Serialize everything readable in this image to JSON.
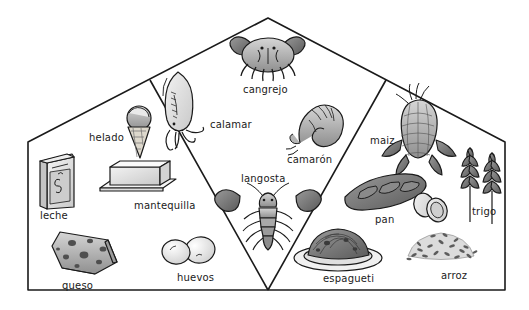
{
  "diagram": {
    "title_text": "",
    "style": "hand-drawn pencil illustration, grayscale",
    "background_color": "#ffffff",
    "line_color": "#1a1a1a",
    "regions": [
      {
        "name": "dairy-region",
        "shape": "left-trapezoid"
      },
      {
        "name": "seafood-region",
        "shape": "center-diamond"
      },
      {
        "name": "grains-region",
        "shape": "right-trapezoid"
      }
    ]
  },
  "items": {
    "leche": {
      "label": "leche",
      "icon": "milk-carton-icon",
      "x": 40,
      "y": 211
    },
    "helado": {
      "label": "helado",
      "icon": "ice-cream-cone-icon",
      "x": 89,
      "y": 133
    },
    "mantequilla": {
      "label": "mantequilla",
      "icon": "butter-stick-icon",
      "x": 134,
      "y": 201
    },
    "queso": {
      "label": "queso",
      "icon": "cheese-wedge-icon",
      "x": 62,
      "y": 281
    },
    "huevos": {
      "label": "huevos",
      "icon": "eggs-icon",
      "x": 177,
      "y": 273
    },
    "cangrejo": {
      "label": "cangrejo",
      "icon": "crab-icon",
      "x": 243,
      "y": 85
    },
    "calamar": {
      "label": "calamar",
      "icon": "squid-icon",
      "x": 210,
      "y": 120
    },
    "camaron": {
      "label": "camarón",
      "icon": "shrimp-icon",
      "x": 287,
      "y": 155
    },
    "langosta": {
      "label": "langosta",
      "icon": "lobster-icon",
      "x": 241,
      "y": 174
    },
    "espagueti": {
      "label": "espagueti",
      "icon": "spaghetti-plate-icon",
      "x": 323,
      "y": 274
    },
    "maiz": {
      "label": "maiz",
      "icon": "corn-cob-icon",
      "x": 370,
      "y": 136
    },
    "pan": {
      "label": "pan",
      "icon": "bread-loaf-icon",
      "x": 375,
      "y": 215
    },
    "trigo": {
      "label": "trigo",
      "icon": "wheat-stalks-icon",
      "x": 472,
      "y": 207
    },
    "arroz": {
      "label": "arroz",
      "icon": "rice-pile-icon",
      "x": 441,
      "y": 271
    }
  },
  "colors": {
    "outline": "#1a1a1a",
    "fill_light": "#e8e8e8",
    "fill_mid": "#b8b8b8",
    "fill_dark": "#7a7a7a",
    "fill_darker": "#4a4a4a",
    "page": "#ffffff"
  }
}
